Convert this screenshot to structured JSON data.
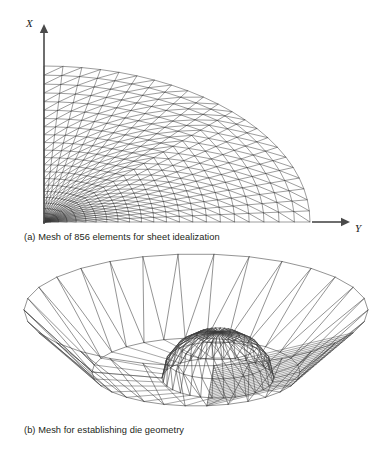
{
  "figure": {
    "background_color": "#ffffff",
    "line_color": "#3a3a3a",
    "text_color": "#231f20"
  },
  "panel_a": {
    "caption": "(a) Mesh of 856 elements for sheet idealization",
    "element_count": "856",
    "axes": {
      "vertical_label": "X",
      "horizontal_label": "Y",
      "vertical_axis": {
        "x": 44,
        "y_top": 24,
        "y_bottom": 224
      },
      "horizontal_axis": {
        "y": 222,
        "x_left": 312,
        "x_right": 350
      }
    },
    "mesh": {
      "type": "quarter-disc-graded-triangulated",
      "origin_x": 44,
      "origin_y": 222,
      "radius_x": 266,
      "radius_y": 156,
      "radial_divisions": 22,
      "angular_divisions": 22,
      "inner_refine_radius_fraction": 0.42,
      "grading_exponent": 1.55,
      "diagonal_direction": "forward",
      "stroke_width": 0.5
    }
  },
  "panel_b": {
    "caption": "(b) Mesh for establishing die geometry",
    "mesh": {
      "type": "axisymmetric-die-surface-wireframe",
      "description": "Conical bowl rim with central dome and collapsed element band",
      "center_x": 196,
      "center_y": 372,
      "rim_radius_x": 172,
      "rim_radius_y": 56,
      "rim_lift": 62,
      "base_radius_x": 104,
      "base_radius_y": 34,
      "dome_radius_x": 56,
      "dome_radius_y": 20,
      "dome_height": 46,
      "angular_divisions": 30,
      "dome_rings": 4,
      "collapsed_band_start": 17,
      "collapsed_band_end": 22,
      "collapsed_band_lines": 22,
      "stroke_width": 0.55
    }
  }
}
